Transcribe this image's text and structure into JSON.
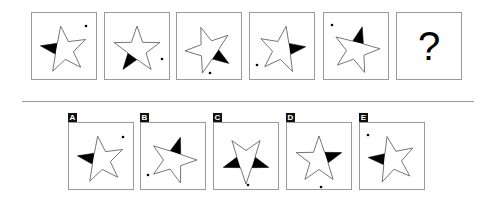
{
  "question": {
    "sequence": [
      {
        "rotation": -8,
        "black_point": 4,
        "dot": [
          54,
          13
        ]
      },
      {
        "rotation": 0,
        "black_point": 3,
        "dot": [
          57,
          46
        ]
      },
      {
        "rotation": -20,
        "black_point": 2,
        "dot": [
          33,
          60
        ]
      },
      {
        "rotation": 10,
        "black_point": 1,
        "dot": [
          7,
          52
        ]
      },
      {
        "rotation": 15,
        "black_point": 0,
        "dot": [
          8,
          12
        ]
      }
    ],
    "unknown_label": "?"
  },
  "options": [
    {
      "label": "A",
      "rotation": -8,
      "black_point": 4,
      "dot": [
        54,
        14
      ]
    },
    {
      "label": "B",
      "rotation": 18,
      "black_point": 0,
      "dot": [
        7,
        52
      ]
    },
    {
      "label": "C",
      "rotation": 180,
      "black_point": 1,
      "black_point_2": 4,
      "dot": [
        34,
        62
      ]
    },
    {
      "label": "D",
      "rotation": 0,
      "black_point": 1,
      "dot": [
        34,
        64
      ]
    },
    {
      "label": "E",
      "rotation": -12,
      "black_point": 4,
      "dot": [
        8,
        12
      ]
    }
  ],
  "colors": {
    "stroke": "#666666",
    "fill": "#000000",
    "border": "#9a9a9a"
  }
}
